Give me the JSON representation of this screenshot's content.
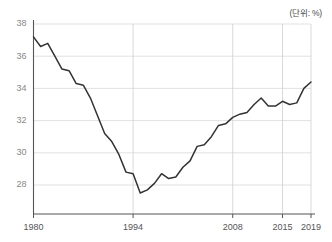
{
  "unit_note": "(단위: %)",
  "chart_data": {
    "type": "line",
    "title": "",
    "subtitle": "",
    "xlabel": "",
    "ylabel": "",
    "unit": "%",
    "unit_note": "(단위: %)",
    "grid": true,
    "legend": false,
    "legend_position": "none",
    "line_color": "#333333",
    "grid_color": "#d9d9d9",
    "axis_color": "#555555",
    "xlim": [
      1980,
      2019
    ],
    "ylim": [
      26.6,
      38.6
    ],
    "ytick_labels": [
      "28",
      "30",
      "32",
      "34",
      "36",
      "38"
    ],
    "yticks": [
      28,
      30,
      32,
      34,
      36,
      38
    ],
    "xtick_labels": [
      "1980",
      "1994",
      "2008",
      "2015",
      "2019"
    ],
    "xticks": [
      1980,
      1994,
      2008,
      2015,
      2019
    ],
    "x": [
      1980,
      1981,
      1982,
      1983,
      1984,
      1985,
      1986,
      1987,
      1988,
      1989,
      1990,
      1991,
      1992,
      1993,
      1994,
      1995,
      1996,
      1997,
      1998,
      1999,
      2000,
      2001,
      2002,
      2003,
      2004,
      2005,
      2006,
      2007,
      2008,
      2009,
      2010,
      2011,
      2012,
      2013,
      2014,
      2015,
      2016,
      2017,
      2018,
      2019
    ],
    "series": [
      {
        "name": "비율",
        "values": [
          37.2,
          36.6,
          36.8,
          36.0,
          35.2,
          35.1,
          34.3,
          34.2,
          33.4,
          32.3,
          31.2,
          30.7,
          29.9,
          28.8,
          28.7,
          27.5,
          27.7,
          28.1,
          28.7,
          28.4,
          28.5,
          29.1,
          29.5,
          30.4,
          30.5,
          31.0,
          31.7,
          31.8,
          32.2,
          32.4,
          32.5,
          33.0,
          33.4,
          32.9,
          32.9,
          33.2,
          33.0,
          33.1,
          34.0,
          34.4
        ]
      }
    ],
    "values_note": "Line begins 37.2 (1980), troughs 27.5 (1994), peaks 34.4 (2015), ends 32.1 (2019)"
  },
  "plot_points": {
    "comment": "year,value pairs traced from the rendered curve",
    "pairs": [
      [
        1980,
        37.2
      ],
      [
        1981,
        36.6
      ],
      [
        1982,
        36.8
      ],
      [
        1983,
        36.0
      ],
      [
        1984,
        35.2
      ],
      [
        1985,
        35.1
      ],
      [
        1986,
        34.3
      ],
      [
        1987,
        34.2
      ],
      [
        1988,
        33.4
      ],
      [
        1989,
        32.3
      ],
      [
        1990,
        31.2
      ],
      [
        1991,
        30.7
      ],
      [
        1992,
        29.9
      ],
      [
        1993,
        28.8
      ],
      [
        1994,
        28.7
      ],
      [
        1995,
        27.5
      ],
      [
        1996,
        27.7
      ],
      [
        1997,
        28.1
      ],
      [
        1998,
        28.7
      ],
      [
        1999,
        28.4
      ],
      [
        2000,
        28.5
      ],
      [
        2001,
        29.1
      ],
      [
        2002,
        29.5
      ],
      [
        2003,
        30.4
      ],
      [
        2004,
        30.5
      ],
      [
        2005,
        31.0
      ],
      [
        2006,
        31.7
      ],
      [
        2007,
        31.8
      ],
      [
        2008,
        32.2
      ],
      [
        2009,
        32.4
      ],
      [
        2010,
        32.5
      ],
      [
        2011,
        33.0
      ],
      [
        2012,
        33.4
      ],
      [
        2013,
        32.9
      ],
      [
        2014,
        32.9
      ],
      [
        2015,
        33.2
      ],
      [
        2016,
        33.0
      ],
      [
        2017,
        33.1
      ],
      [
        2018,
        34.0
      ],
      [
        2019,
        34.4
      ]
    ]
  }
}
